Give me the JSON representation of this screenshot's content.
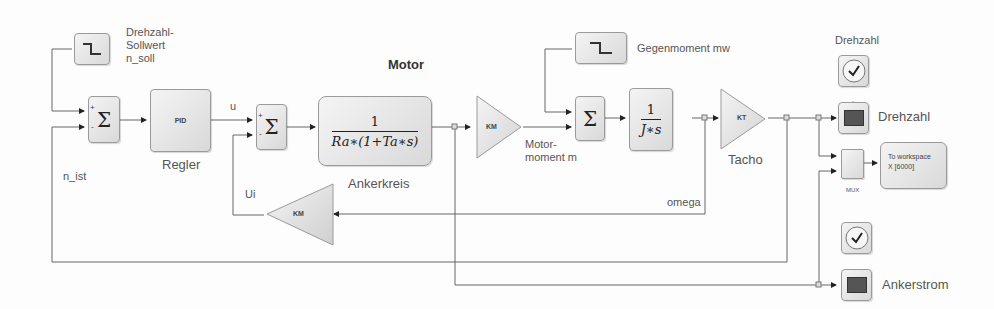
{
  "diagram": {
    "title": "Motor",
    "blocks": {
      "step_nsoll": {
        "label_lines": [
          "Drehzahl-",
          "Sollwert",
          "n_soll"
        ]
      },
      "sum1": {
        "symbol": "Σ",
        "signs": [
          "+",
          "-"
        ]
      },
      "pid": {
        "text": "PID",
        "label": "Regler"
      },
      "sum2": {
        "symbol": "Σ",
        "signs": [
          "+",
          "-"
        ]
      },
      "ankerkreis": {
        "numerator": "1",
        "denominator": "Ra∗(1+Ta∗s)",
        "label": "Ankerkreis"
      },
      "gain_km1": {
        "text": "KM"
      },
      "step_mw": {
        "label": "Gegenmoment mw"
      },
      "sum3": {
        "symbol": "Σ",
        "signs": [
          "-",
          "+"
        ]
      },
      "integrator": {
        "numerator": "1",
        "denominator": "J∗s"
      },
      "gain_kt": {
        "text": "KT",
        "label": "Tacho"
      },
      "clock1": {
        "label": "Drehzahl"
      },
      "scope1": {
        "label": "Drehzahl"
      },
      "mux": {
        "label": "MUX"
      },
      "to_workspace": {
        "line1": "To workspace",
        "line2": "X [6000]"
      },
      "gain_km2": {
        "text": "KM"
      },
      "clock2": {},
      "scope2": {
        "label": "Ankerstrom"
      }
    },
    "signals": {
      "u": "u",
      "n_ist": "n_ist",
      "ui": "Ui",
      "motormoment_line1": "Motor-",
      "motormoment_line2": "moment m",
      "omega": "omega"
    }
  }
}
